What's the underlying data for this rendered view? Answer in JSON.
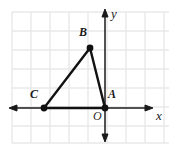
{
  "figure": {
    "type": "coordinate-plane-triangle",
    "background_color": "#ffffff",
    "grid": {
      "color": "#e9e9e9",
      "cell_size": 19,
      "x_start": 12,
      "x_end": 169,
      "y_start": 12,
      "y_end": 143,
      "visible": true
    },
    "axes": {
      "color": "#1a1a1a",
      "x_axis": {
        "label": "x",
        "label_x": 158,
        "label_y": 113,
        "y_pixel": 108,
        "x_from": 10,
        "x_to": 152,
        "arrow_left": true,
        "arrow_right": true
      },
      "y_axis": {
        "label": "y",
        "label_x": 112,
        "label_y": 11,
        "x_pixel": 105,
        "y_from": 10,
        "y_to": 140,
        "arrow_up": true,
        "arrow_down": true
      },
      "origin_label": "O",
      "origin_label_x": 94,
      "origin_label_y": 111
    },
    "points": [
      {
        "name": "A",
        "x": 105,
        "y": 108,
        "label": "A",
        "label_x": 108,
        "label_y": 92,
        "radius": 3.4
      },
      {
        "name": "B",
        "x": 90,
        "y": 48,
        "label": "B",
        "label_x": 80,
        "label_y": 29,
        "radius": 3.4
      },
      {
        "name": "C",
        "x": 44,
        "y": 108,
        "label": "C",
        "label_x": 31,
        "label_y": 92,
        "radius": 3.4
      }
    ],
    "triangle": {
      "vertices": "A,B,C",
      "stroke_color": "#111111",
      "stroke_width": 2.4,
      "fill": "none",
      "path": "M105,108 L90,48 L44,108 Z"
    },
    "point_color": "#111111"
  }
}
